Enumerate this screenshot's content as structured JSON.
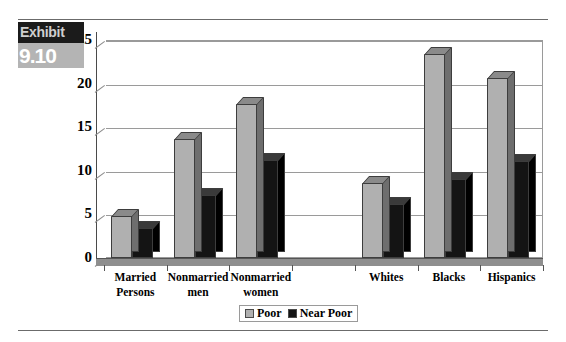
{
  "exhibit": {
    "word": "Exhibit",
    "number": "9.10"
  },
  "legend": {
    "position": "bottom-center",
    "items": [
      {
        "label": "Poor",
        "color": "#b0b0b0",
        "swatch": "poor-swatch"
      },
      {
        "label": "Near Poor",
        "color": "#141414",
        "swatch": "near-poor-swatch"
      }
    ]
  },
  "chart_data": {
    "type": "bar",
    "title": "",
    "xlabel": "",
    "ylabel": "",
    "ylim": [
      0,
      25
    ],
    "yticks": [
      0,
      5,
      10,
      15,
      20,
      25
    ],
    "grid": true,
    "categories": [
      "Married Persons",
      "Nonmarried men",
      "Nonmarried women",
      "",
      "Whites",
      "Blacks",
      "Hispanics"
    ],
    "category_lines": [
      [
        "Married",
        "Persons"
      ],
      [
        "Nonmarried",
        "men"
      ],
      [
        "Nonmarried",
        "women"
      ],
      [
        "",
        ""
      ],
      [
        "Whites",
        ""
      ],
      [
        "Blacks",
        ""
      ],
      [
        "Hispanics",
        ""
      ]
    ],
    "series": [
      {
        "name": "Poor",
        "color": "#b0b0b0",
        "values": [
          4.8,
          13.6,
          17.7,
          0,
          8.6,
          23.4,
          20.7
        ]
      },
      {
        "name": "Near Poor",
        "color": "#141414",
        "values": [
          3.4,
          7.2,
          11.2,
          0,
          6.2,
          9.1,
          11.1
        ]
      }
    ]
  }
}
